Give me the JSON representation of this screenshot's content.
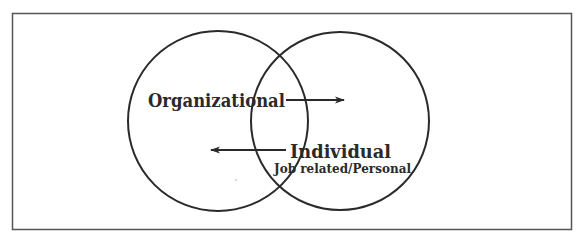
{
  "diagram": {
    "type": "venn",
    "colors": {
      "stroke": "#2a2a2a",
      "frame": "#555555",
      "background": "#ffffff",
      "text": "#2a2a2a"
    },
    "frame": {
      "x": 12,
      "y": 13,
      "width": 560,
      "height": 217
    },
    "circles": [
      {
        "id": "organizational",
        "cx": 218,
        "cy": 121,
        "r": 90
      },
      {
        "id": "individual",
        "cx": 340,
        "cy": 121,
        "r": 89
      }
    ],
    "labels": {
      "organizational": "Organizational",
      "individual": "Individual",
      "individual_sub": "Job related/Personal"
    },
    "arrows": [
      {
        "id": "organizational-to-individual",
        "x1": 286,
        "y1": 100,
        "x2": 344,
        "y2": 100,
        "direction": "right"
      },
      {
        "id": "individual-to-organizational",
        "x1": 286,
        "y1": 150,
        "x2": 211,
        "y2": 150,
        "direction": "left"
      }
    ]
  }
}
